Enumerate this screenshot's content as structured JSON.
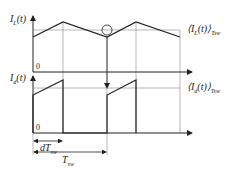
{
  "labels": {
    "il": "I",
    "il_sub": "L",
    "il_arg": "(t)",
    "id": "I",
    "id_sub": "d",
    "id_arg": "(t)",
    "avg_il": "⟨I",
    "avg_il_sub": "L",
    "avg_il_rest": "(t)⟩",
    "avg_id": "⟨I",
    "avg_id_sub": "d",
    "avg_id_rest": "(t)⟩",
    "tsw_sub": "Tsw",
    "zero_top": "0",
    "zero_bottom": "0",
    "dtsw": "dT",
    "dtsw_sub": "sw",
    "tsw": "T",
    "tsw_sub2": "sw"
  },
  "colors": {
    "line": "#222222",
    "grid": "#888888"
  }
}
